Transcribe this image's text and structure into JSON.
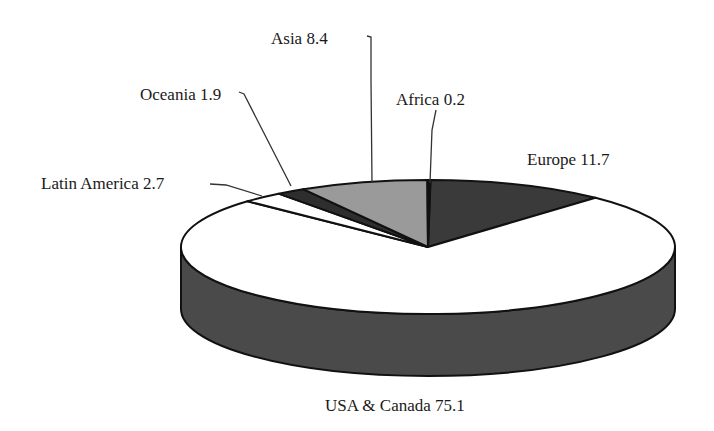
{
  "chart_data": {
    "type": "pie",
    "style": "3d",
    "title": "",
    "categories": [
      "USA & Canada",
      "Europe",
      "Africa",
      "Asia",
      "Oceania",
      "Latin America"
    ],
    "values": [
      75.1,
      11.7,
      0.2,
      8.4,
      1.9,
      2.7
    ],
    "colors": [
      "#ffffff",
      "#3a3a3a",
      "#111111",
      "#9a9a9a",
      "#2e2e2e",
      "#ffffff"
    ],
    "side_color": "#4a4a4a",
    "legend": "none (direct labels)"
  },
  "labels": {
    "usa": "USA & Canada 75.1",
    "europe": "Europe 11.7",
    "africa": "Africa 0.2",
    "asia": "Asia 8.4",
    "oceania": "Oceania 1.9",
    "latin": "Latin America 2.7"
  }
}
